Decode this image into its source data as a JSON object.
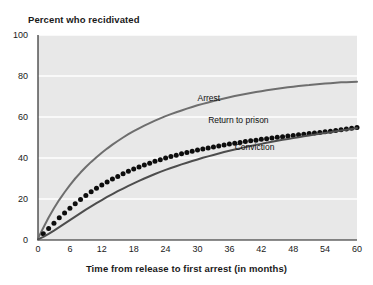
{
  "chart_data": {
    "type": "line",
    "title": "Percent who recidivated",
    "xlabel": "Time from release to first arrest (in months)",
    "ylabel": "",
    "xlim": [
      0,
      60
    ],
    "ylim": [
      0,
      100
    ],
    "grid": true,
    "legend_position": "inline-annotations",
    "xticks": [
      "0",
      "6",
      "12",
      "18",
      "24",
      "30",
      "36",
      "42",
      "48",
      "54",
      "60"
    ],
    "yticks": [
      "0",
      "20",
      "40",
      "60",
      "80",
      "100"
    ],
    "x": [
      0,
      1,
      2,
      3,
      4,
      5,
      6,
      7,
      8,
      9,
      10,
      11,
      12,
      13,
      14,
      15,
      16,
      17,
      18,
      19,
      20,
      21,
      22,
      23,
      24,
      25,
      26,
      27,
      28,
      29,
      30,
      31,
      32,
      33,
      34,
      35,
      36,
      37,
      38,
      39,
      40,
      41,
      42,
      43,
      44,
      45,
      46,
      47,
      48,
      49,
      50,
      51,
      52,
      53,
      54,
      55,
      56,
      57,
      58,
      59,
      60
    ],
    "series": [
      {
        "name": "Arrest",
        "style": "line",
        "color": "#6e6e6e",
        "label_x": 30,
        "label_y": 69,
        "values": [
          0.8,
          6.0,
          11.0,
          15.5,
          19.6,
          23.3,
          26.8,
          30.0,
          32.9,
          35.6,
          38.1,
          40.4,
          42.6,
          44.6,
          46.5,
          48.3,
          50.0,
          51.6,
          53.1,
          54.5,
          55.8,
          57.0,
          58.2,
          59.3,
          60.4,
          61.4,
          62.3,
          63.2,
          64.1,
          64.9,
          65.7,
          66.4,
          67.1,
          67.8,
          68.4,
          69.0,
          69.6,
          70.2,
          70.7,
          71.2,
          71.7,
          72.2,
          72.6,
          73.0,
          73.4,
          73.8,
          74.2,
          74.5,
          74.8,
          75.1,
          75.4,
          75.6,
          75.9,
          76.1,
          76.3,
          76.5,
          76.7,
          76.9,
          77.0,
          77.1,
          77.2
        ]
      },
      {
        "name": "Return to prison",
        "style": "dots",
        "color": "#0d0d0d",
        "label_x": 32,
        "label_y": 58,
        "values": [
          0.5,
          3.0,
          5.6,
          8.2,
          10.8,
          13.2,
          15.5,
          17.7,
          19.8,
          21.7,
          23.5,
          25.2,
          26.8,
          28.3,
          29.7,
          31.0,
          32.3,
          33.5,
          34.6,
          35.6,
          36.6,
          37.5,
          38.4,
          39.2,
          40.0,
          40.7,
          41.4,
          42.1,
          42.7,
          43.3,
          43.9,
          44.4,
          44.9,
          45.4,
          45.9,
          46.4,
          46.8,
          47.2,
          47.6,
          48.0,
          48.4,
          48.7,
          49.1,
          49.4,
          49.7,
          50.1,
          50.4,
          50.7,
          51.0,
          51.3,
          51.6,
          51.9,
          52.2,
          52.5,
          52.8,
          53.1,
          53.4,
          53.8,
          54.1,
          54.5,
          54.9
        ]
      },
      {
        "name": "Conviction",
        "style": "line",
        "color": "#4d4d4d",
        "label_x": 37,
        "label_y": 45,
        "values": [
          0.3,
          1.5,
          3.0,
          4.6,
          6.3,
          8.0,
          9.7,
          11.4,
          13.1,
          14.8,
          16.4,
          18.0,
          19.5,
          21.0,
          22.4,
          23.8,
          25.1,
          26.4,
          27.6,
          28.8,
          30.0,
          31.1,
          32.2,
          33.2,
          34.2,
          35.1,
          36.0,
          36.9,
          37.7,
          38.5,
          39.3,
          40.1,
          40.8,
          41.5,
          42.2,
          42.9,
          43.5,
          44.1,
          44.7,
          45.3,
          45.9,
          46.4,
          46.9,
          47.4,
          47.9,
          48.4,
          48.9,
          49.3,
          49.7,
          50.1,
          50.6,
          51.0,
          51.4,
          51.8,
          52.2,
          52.6,
          53.0,
          53.4,
          53.8,
          54.2,
          54.6
        ]
      }
    ]
  },
  "colors": {
    "plot_background": "#e8e8e8",
    "page_background": "#ffffff",
    "gridline": "#ffffff",
    "text": "#1a1a1a"
  }
}
